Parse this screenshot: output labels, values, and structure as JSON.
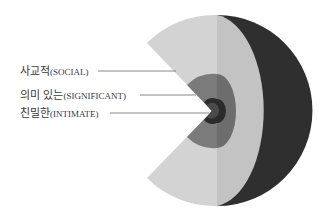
{
  "diagram": {
    "type": "concentric-circles-pacman",
    "colors": {
      "social_left": "#d2d2d2",
      "social_right": "#c4c4c4",
      "outer_crescent": "#2f2f2f",
      "significant_left": "#7a7a7a",
      "significant_right": "#6e6e6e",
      "intimate": "#2a2a2a",
      "intimate_core": "#444444"
    },
    "labels": [
      {
        "id": "social",
        "korean": "사교적",
        "english": "(SOCIAL)"
      },
      {
        "id": "significant",
        "korean": "의미 있는",
        "english": "(SIGNIFICANT)"
      },
      {
        "id": "intimate",
        "korean": "친밀한",
        "english": "(INTIMATE)"
      }
    ]
  }
}
